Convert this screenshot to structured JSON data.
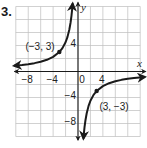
{
  "problem": {
    "number": "3."
  },
  "chart_data": {
    "type": "line",
    "title": "",
    "function": "y = -9/x",
    "xlabel": "x",
    "ylabel": "y",
    "xlim": [
      -10,
      10
    ],
    "ylim": [
      -10,
      10
    ],
    "grid": true,
    "grid_step": 2,
    "x_ticks": [
      {
        "value": -8,
        "label": "−8"
      },
      {
        "value": -4,
        "label": "−4"
      },
      {
        "value": 0,
        "label": "0"
      },
      {
        "value": 4,
        "label": "4"
      }
    ],
    "y_ticks": [
      {
        "value": 4,
        "label": "4"
      },
      {
        "value": -4,
        "label": "−4"
      },
      {
        "value": -8,
        "label": "−8"
      }
    ],
    "asymptotes": {
      "vertical": 0,
      "horizontal": 0
    },
    "series": [
      {
        "name": "left branch",
        "x": [
          -10.3,
          -9,
          -8,
          -7,
          -6,
          -5,
          -4,
          -3,
          -2.5,
          -2,
          -1.7,
          -1.4,
          -1.2,
          -1.05,
          -0.95,
          -0.86
        ],
        "y": [
          0.87,
          1,
          1.125,
          1.286,
          1.5,
          1.8,
          2.25,
          3,
          3.6,
          4.5,
          5.29,
          6.43,
          7.5,
          8.57,
          9.47,
          10.47
        ]
      },
      {
        "name": "right branch",
        "x": [
          0.87,
          0.95,
          1.05,
          1.2,
          1.4,
          1.7,
          2,
          2.5,
          3,
          4,
          5,
          6,
          7,
          8,
          9,
          10.8
        ],
        "y": [
          -10.34,
          -9.47,
          -8.57,
          -7.5,
          -6.43,
          -5.29,
          -4.5,
          -3.6,
          -3,
          -2.25,
          -1.8,
          -1.5,
          -1.286,
          -1.125,
          -1,
          -0.83
        ]
      }
    ],
    "points": [
      {
        "x": -3,
        "y": 3,
        "label": "(−3, 3)"
      },
      {
        "x": 3,
        "y": -3,
        "label": "(3, −3)"
      }
    ],
    "colors": {
      "curve": "#1a1a1a",
      "grid": "#bdbdbd",
      "axis": "#1a1a1a"
    }
  }
}
